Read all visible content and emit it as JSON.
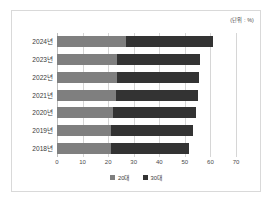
{
  "unit_note": "(단위 : %)",
  "chart_data": {
    "type": "bar",
    "orientation": "horizontal",
    "stacked": true,
    "title": "",
    "subtitle": "",
    "xlabel": "",
    "ylabel": "",
    "unit": "(단위 : %)",
    "xlim": [
      0,
      70
    ],
    "xticks": [
      0,
      10,
      20,
      30,
      40,
      50,
      60,
      70
    ],
    "xtick_labels": [
      "0",
      "10",
      "20",
      "30",
      "40",
      "50",
      "60",
      "70"
    ],
    "grid": true,
    "grid_axis": "x",
    "legend_position": "bottom",
    "categories": [
      "2024년",
      "2023년",
      "2022년",
      "2021년",
      "2020년",
      "2019년",
      "2018년"
    ],
    "series": [
      {
        "name": "20대",
        "color": "#7f7f7f",
        "values": [
          27.0,
          23.5,
          23.5,
          23.0,
          22.0,
          21.0,
          21.0
        ]
      },
      {
        "name": "30대",
        "color": "#333333",
        "values": [
          34.0,
          32.5,
          32.0,
          32.0,
          32.5,
          32.0,
          30.5
        ]
      }
    ],
    "totals": [
      61.0,
      56.0,
      55.5,
      55.0,
      54.5,
      53.0,
      51.5
    ]
  },
  "colors": {
    "series_a": "#7f7f7f",
    "series_b": "#333333",
    "gridline": "#d6d6d6",
    "frame_border": "#d9d9d9",
    "background": "#ffffff",
    "text": "#3a3a3a"
  }
}
